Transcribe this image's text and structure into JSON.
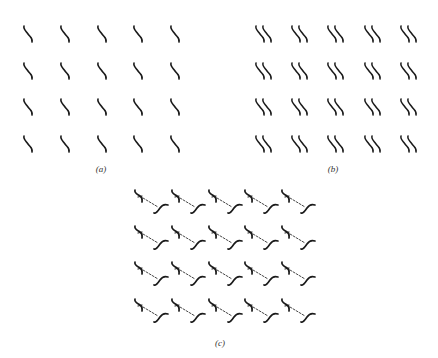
{
  "figure": {
    "panels": [
      {
        "id": "a",
        "label": "(a)",
        "motif": "single-s-curve",
        "rows": 4,
        "cols": 5,
        "col_x": [
          23,
          60,
          97,
          133,
          170
        ],
        "row_y": [
          25,
          62,
          98,
          135
        ],
        "label_pos": [
          101,
          164
        ]
      },
      {
        "id": "b",
        "label": "(b)",
        "motif": "double-s-curve",
        "rows": 4,
        "cols": 5,
        "col_x": [
          255,
          291,
          327,
          364,
          400
        ],
        "row_y": [
          25,
          62,
          98,
          135
        ],
        "label_pos": [
          333,
          164
        ]
      },
      {
        "id": "c",
        "label": "(c)",
        "motif": "s-curve-pair-dashed-link",
        "rows": 4,
        "cols": 5,
        "col_x": [
          134,
          171,
          208,
          244,
          281
        ],
        "row_y": [
          189,
          225,
          261,
          298
        ],
        "label_pos": [
          220,
          338
        ]
      }
    ],
    "colors": {
      "ink": "#1a1a1a",
      "label": "#333333",
      "background": "#ffffff"
    }
  }
}
